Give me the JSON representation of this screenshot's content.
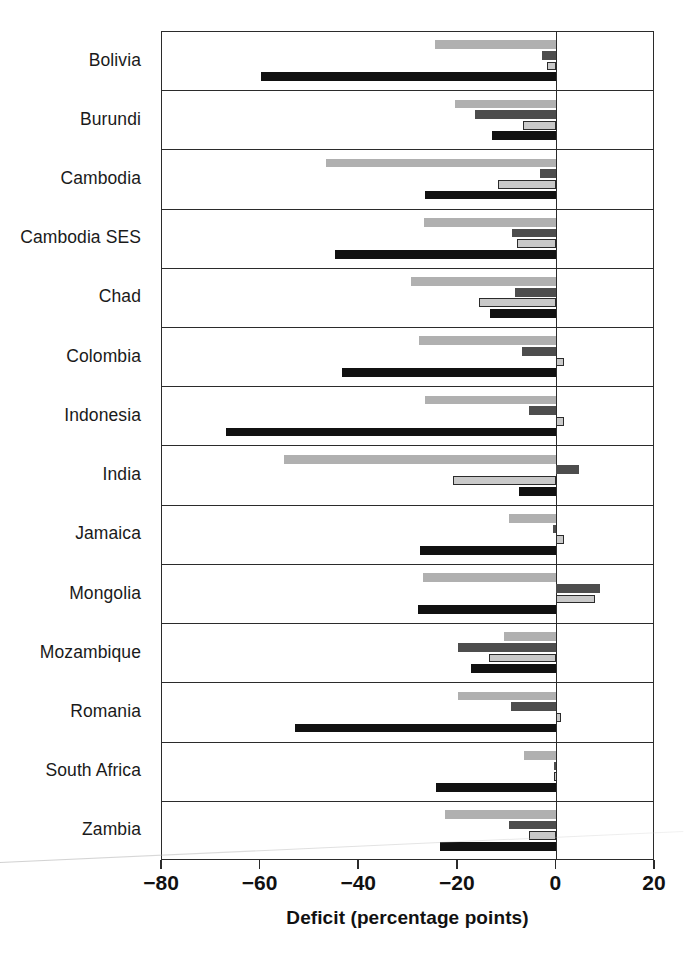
{
  "chart_data": {
    "type": "bar",
    "orientation": "horizontal",
    "title": "",
    "xlabel": "Deficit (percentage points)",
    "ylabel": "",
    "xlim": [
      -80,
      20
    ],
    "xticks": [
      -80,
      -60,
      -40,
      -20,
      0,
      20
    ],
    "xtick_labels": [
      "−80",
      "−60",
      "−40",
      "−20",
      "0",
      "20"
    ],
    "grid": false,
    "legend": "none",
    "zero_reference": 0,
    "categories": [
      "Bolivia",
      "Burundi",
      "Cambodia",
      "Cambodia SES",
      "Chad",
      "Colombia",
      "Indonesia",
      "India",
      "Jamaica",
      "Mongolia",
      "Mozambique",
      "Romania",
      "South Africa",
      "Zambia"
    ],
    "series": [
      {
        "name": "series-1",
        "color": "#b0b0b0",
        "style": "light-gray",
        "values": [
          -24.7,
          -20.5,
          -46.7,
          -26.8,
          -29.4,
          -27.8,
          -26.6,
          -55.2,
          -9.7,
          -27.0,
          -10.6,
          -20.0,
          -6.5,
          -22.5
        ]
      },
      {
        "name": "series-2",
        "color": "#4d4d4d",
        "style": "dark-gray",
        "values": [
          -3.0,
          -16.5,
          -3.4,
          -9.1,
          -8.3,
          -6.9,
          -5.5,
          4.6,
          -0.6,
          8.8,
          -20.0,
          -9.3,
          -0.5,
          -9.7
        ]
      },
      {
        "name": "series-3",
        "color": "#c9c9c9",
        "style": "light-gray-outlined",
        "values": [
          -2.0,
          -6.8,
          -11.8,
          -7.9,
          -15.8,
          1.5,
          1.5,
          -21.0,
          1.5,
          7.8,
          -13.6,
          1.0,
          -0.4,
          -5.5
        ]
      },
      {
        "name": "series-4",
        "color": "#111111",
        "style": "black",
        "values": [
          -60.0,
          -13.0,
          -26.6,
          -45.0,
          -13.4,
          -43.4,
          -67.0,
          -7.5,
          -27.6,
          -28.0,
          -17.4,
          -53.0,
          -24.5,
          -23.7
        ]
      }
    ]
  },
  "axis": {
    "x_title": "Deficit (percentage points)"
  }
}
